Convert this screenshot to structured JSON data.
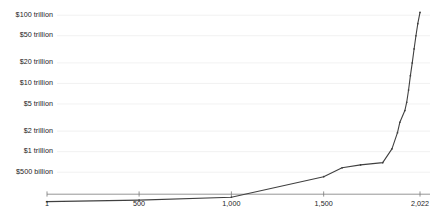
{
  "chart_data": {
    "type": "line",
    "title": "",
    "subtitle": "",
    "xlabel": "",
    "ylabel": "",
    "yscale": "log",
    "xscale": "linear",
    "grid": true,
    "legend": null,
    "xlim": [
      1,
      2022
    ],
    "ylim": [
      180000000000,
      130000000000000
    ],
    "xticks": [
      1,
      500,
      1000,
      1500,
      2022
    ],
    "xtick_labels": [
      "1",
      "500",
      "1,000",
      "1,500",
      "2,022"
    ],
    "yticks": [
      500000000000,
      1000000000000,
      2000000000000,
      5000000000000,
      10000000000000,
      20000000000000,
      50000000000000,
      100000000000000
    ],
    "ytick_labels": [
      "$500 billion",
      "$1 trillion",
      "$2 trillion",
      "$5 trillion",
      "$10 trillion",
      "$20 trillion",
      "$50 trillion",
      "$100 trillion"
    ],
    "series": [
      {
        "name": "World GDP",
        "color": "#404040",
        "marker": "dot",
        "x": [
          1,
          500,
          1000,
          1500,
          1600,
          1700,
          1820,
          1870,
          1900,
          1913,
          1940,
          1950,
          1960,
          1970,
          1980,
          1990,
          2000,
          2010,
          2022
        ],
        "y": [
          185000000000,
          195000000000,
          215000000000,
          430000000000,
          580000000000,
          640000000000,
          690000000000,
          1100000000000,
          1900000000000,
          2700000000000,
          4000000000000,
          5300000000000,
          8000000000000,
          13000000000000,
          20000000000000,
          32000000000000,
          50000000000000,
          75000000000000,
          110000000000000
        ]
      }
    ]
  },
  "colors": {
    "line": "#404040",
    "gridline": "#ededed",
    "axis": "#7a7a7a",
    "text": "#1c1c1c",
    "background": "#ffffff"
  }
}
